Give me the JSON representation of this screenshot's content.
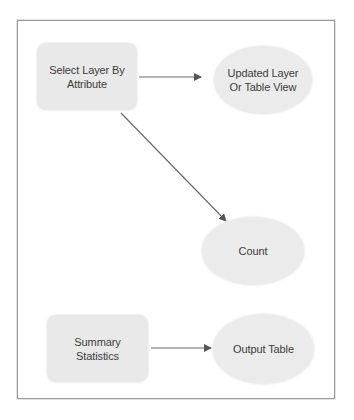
{
  "diagram": {
    "type": "model-builder-flow",
    "colors": {
      "frame_border": "#9a9a9a",
      "node_fill": "#e9e9e9",
      "arrow": "#5a5a5a",
      "text": "#3c3c3c"
    },
    "nodes": [
      {
        "id": "select_layer",
        "shape": "rounded-rect",
        "kind": "tool",
        "label": "Select Layer By Attribute",
        "lines": [
          "Select Layer By",
          "Attribute"
        ]
      },
      {
        "id": "updated_layer",
        "shape": "ellipse",
        "kind": "output",
        "label": "Updated Layer Or Table View",
        "lines": [
          "Updated Layer",
          "Or Table View"
        ]
      },
      {
        "id": "count",
        "shape": "ellipse",
        "kind": "output",
        "label": "Count",
        "lines": [
          "Count"
        ]
      },
      {
        "id": "summary_stats",
        "shape": "rounded-rect",
        "kind": "tool",
        "label": "Summary Statistics",
        "lines": [
          "Summary",
          "Statistics"
        ]
      },
      {
        "id": "output_table",
        "shape": "ellipse",
        "kind": "output",
        "label": "Output Table",
        "lines": [
          "Output Table"
        ]
      }
    ],
    "edges": [
      {
        "from": "select_layer",
        "to": "updated_layer"
      },
      {
        "from": "select_layer",
        "to": "count"
      },
      {
        "from": "summary_stats",
        "to": "output_table"
      }
    ]
  }
}
